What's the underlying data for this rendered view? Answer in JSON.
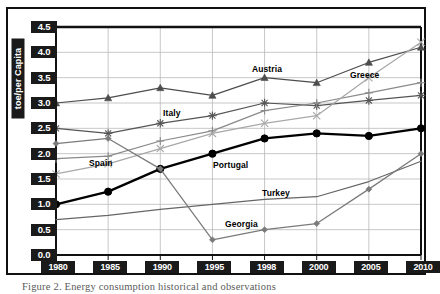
{
  "figure": {
    "caption": "Figure 2. Energy consumption historical and observations"
  },
  "axis": {
    "y_title": "toe/per Capita",
    "y_ticks": [
      "0.0",
      "0.5",
      "1.0",
      "1.5",
      "2.0",
      "2.5",
      "3.0",
      "3.5",
      "4.0",
      "4.5"
    ],
    "x_ticks": [
      "1980",
      "1985",
      "1990",
      "1995",
      "1998",
      "2000",
      "2005",
      "2010"
    ]
  },
  "series_labels": {
    "austria": "Austria",
    "greece": "Greece",
    "italy": "Italy",
    "spain": "Spain",
    "portugal": "Portugal",
    "turkey": "Turkey",
    "georgia": "Georgia"
  },
  "colors": {
    "austria": "#4d4d4d",
    "italy": "#555555",
    "spain": "#8a8a8a",
    "greece": "#a8a8a8",
    "portugal": "#000000",
    "turkey": "#666666",
    "georgia": "#7a7a7a",
    "grid": "#b9b9b9",
    "frame": "#111111",
    "tick_bg": "#1a1a1a",
    "tick_fg": "#ffffff"
  },
  "chart_data": {
    "type": "line",
    "title": "",
    "xlabel": "",
    "ylabel": "toe/per Capita",
    "categories": [
      "1980",
      "1985",
      "1990",
      "1995",
      "1998",
      "2000",
      "2005",
      "2010"
    ],
    "ylim": [
      0.0,
      4.5
    ],
    "ytick_step": 0.5,
    "grid": true,
    "legend": "inline-annotations",
    "series": [
      {
        "name": "Austria",
        "marker": "triangle",
        "values": [
          3.0,
          3.1,
          3.3,
          3.15,
          3.5,
          3.4,
          3.8,
          4.1
        ]
      },
      {
        "name": "Italy",
        "marker": "asterisk",
        "values": [
          2.5,
          2.4,
          2.6,
          2.75,
          3.0,
          2.95,
          3.05,
          3.15
        ]
      },
      {
        "name": "Spain",
        "marker": "plus",
        "values": [
          1.9,
          1.95,
          2.25,
          2.45,
          2.85,
          3.0,
          3.2,
          3.4
        ]
      },
      {
        "name": "Greece",
        "marker": "cross",
        "values": [
          1.6,
          1.8,
          2.1,
          2.4,
          2.6,
          2.75,
          3.5,
          4.2
        ]
      },
      {
        "name": "Portugal",
        "marker": "circle",
        "values": [
          1.0,
          1.25,
          1.7,
          2.0,
          2.3,
          2.4,
          2.35,
          2.5
        ]
      },
      {
        "name": "Turkey",
        "marker": "none",
        "values": [
          0.7,
          0.78,
          0.9,
          1.0,
          1.1,
          1.15,
          1.45,
          1.85
        ]
      },
      {
        "name": "Georgia",
        "marker": "diamond",
        "values": [
          2.2,
          2.3,
          1.7,
          0.3,
          0.5,
          0.62,
          1.3,
          2.0
        ]
      }
    ]
  }
}
